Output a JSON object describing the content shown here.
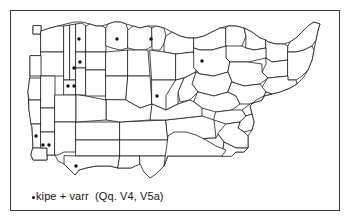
{
  "figure": {
    "type": "linguistic-distribution-map",
    "background_color": "#ffffff",
    "frame_color": "#3a3a3a",
    "line_color": "#1d1d1d",
    "marker_color": "#111111"
  },
  "caption": {
    "bullet_icon": "filled-dot",
    "text": "kipe + varr  (Qq. V4, V5a)",
    "full_text": "•kipe + varr  (Qq. V4, V5a)",
    "lexical_items": [
      "kipe",
      "varr"
    ],
    "question_refs": [
      "Qq. V4",
      "V5a"
    ]
  },
  "map": {
    "marker_count": 10,
    "markers": [
      {
        "id": "m1",
        "x": 79,
        "y": 39
      },
      {
        "id": "m2",
        "x": 117,
        "y": 39
      },
      {
        "id": "m3",
        "x": 151,
        "y": 39
      },
      {
        "id": "m4",
        "x": 80,
        "y": 62
      },
      {
        "id": "m5",
        "x": 74,
        "y": 68
      },
      {
        "id": "m6",
        "x": 68,
        "y": 86
      },
      {
        "id": "m7",
        "x": 74,
        "y": 86
      },
      {
        "id": "m8",
        "x": 202,
        "y": 61
      },
      {
        "id": "m9",
        "x": 157,
        "y": 96
      },
      {
        "id": "m10",
        "x": 36,
        "y": 136
      },
      {
        "id": "m11",
        "x": 43,
        "y": 145
      },
      {
        "id": "m12",
        "x": 49,
        "y": 145
      },
      {
        "id": "m13",
        "x": 76,
        "y": 166
      }
    ],
    "region_outline_count": 70
  }
}
